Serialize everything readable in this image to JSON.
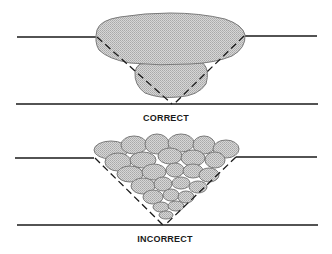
{
  "diagrams": [
    {
      "id": "correct",
      "label": "CORRECT",
      "description": "Weld joint cross-section with one large cap bead over a root bead"
    },
    {
      "id": "incorrect",
      "label": "INCORRECT",
      "description": "Weld joint cross-section filled with many small stringer beads"
    }
  ],
  "colors": {
    "plate_line": "#1a1a1a",
    "bead_fill": "#c8c8c8",
    "bead_stroke": "#7a7a7a",
    "groove_dash": "#1a1a1a"
  }
}
